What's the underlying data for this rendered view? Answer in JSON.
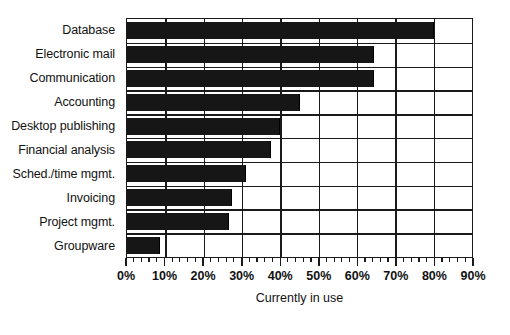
{
  "chart_data": {
    "type": "bar",
    "orientation": "horizontal",
    "title": "",
    "subtitle": "",
    "xlabel": "Currently in use",
    "ylabel": "",
    "categories": [
      "Database",
      "Electronic mail",
      "Communication",
      "Accounting",
      "Desktop publishing",
      "Financial analysis",
      "Sched./time mgmt.",
      "Invoicing",
      "Project mgmt.",
      "Groupware"
    ],
    "values": [
      80,
      64.5,
      64.5,
      45,
      40,
      37.5,
      31,
      27.5,
      26.5,
      8.5
    ],
    "value_unit": "%",
    "xlim": [
      0,
      90
    ],
    "x_tick_labels": [
      "0%",
      "10%",
      "20%",
      "30%",
      "40%",
      "50%",
      "60%",
      "70%",
      "80%",
      "90%"
    ],
    "x_tick_values": [
      0,
      10,
      20,
      30,
      40,
      50,
      60,
      70,
      80,
      90
    ],
    "x_minor_tick_step": 2,
    "grid": true,
    "grid_axis": "x",
    "legend": false,
    "legend_position": "none",
    "bar_color": "#161616",
    "axis_color": "#1a1a1a",
    "background_color": "#ffffff"
  }
}
